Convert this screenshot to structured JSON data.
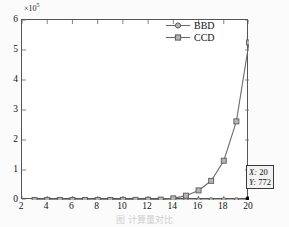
{
  "axis": {
    "y_multiplier_base": "×10",
    "y_multiplier_exponent": "5",
    "y_ticks": [
      "6",
      "5",
      "4",
      "3",
      "2",
      "1",
      "0"
    ],
    "x_ticks": [
      "2",
      "4",
      "6",
      "8",
      "10",
      "12",
      "14",
      "16",
      "18",
      "20"
    ]
  },
  "legend": {
    "items": [
      {
        "label": "BBD",
        "marker": "circle"
      },
      {
        "label": "CCD",
        "marker": "square"
      }
    ]
  },
  "datatip": {
    "x_key": "X:",
    "x_value": "20",
    "y_key": "Y:",
    "y_value": "772"
  },
  "caption": {
    "text": "图  计算量对比"
  },
  "colors": {
    "line": "#6b6b6b",
    "marker_edge": "#5a5a5a",
    "marker_face": "#b5b5b5",
    "selected_marker": "#000000",
    "axis": "#555555",
    "tick": "#777777",
    "plot_background": "#ffffff",
    "page_background": "#fbfbfb",
    "datatip_background": "#f2f2f2",
    "datatip_border": "#3a3a3a"
  },
  "chart_data": {
    "type": "line",
    "title": "",
    "xlabel": "",
    "ylabel": "",
    "xlim": [
      2,
      20
    ],
    "ylim": [
      0,
      6
    ],
    "y_scale_factor": 100000,
    "grid": false,
    "legend_position": "top-right",
    "x": [
      3,
      4,
      5,
      6,
      7,
      8,
      9,
      10,
      11,
      12,
      13,
      14,
      15,
      16,
      17,
      18,
      19,
      20
    ],
    "series": [
      {
        "name": "BBD",
        "marker": "circle",
        "values": [
          0.0001,
          0.00012,
          0.00014,
          0.00016,
          0.00018,
          0.0002,
          0.00022,
          0.00024,
          0.00026,
          0.00028,
          0.0003,
          0.00032,
          0.00035,
          0.00039,
          0.00044,
          0.0005,
          0.00058,
          0.00772
        ]
      },
      {
        "name": "CCD",
        "marker": "square",
        "values": [
          0.0002,
          0.0004,
          0.0006,
          0.0009,
          0.0013,
          0.0019,
          0.0027,
          0.0039,
          0.0057,
          0.0085,
          0.0135,
          0.055,
          0.145,
          0.32,
          0.64,
          1.31,
          2.62,
          5.25
        ]
      }
    ],
    "annotations": [
      {
        "type": "datatip",
        "x": 20,
        "y": 772,
        "text": "X: 20  Y: 772"
      }
    ]
  }
}
